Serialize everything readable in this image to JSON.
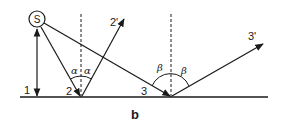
{
  "diagram": {
    "caption": "b",
    "source_label": "S",
    "labels": {
      "ray1": "1",
      "ray2_incident": "2",
      "ray2_reflected": "2'",
      "ray3_incident": "3",
      "ray3_reflected": "3'"
    },
    "angles": {
      "ray2_incidence": "α",
      "ray2_reflection": "α",
      "ray3_incidence": "β",
      "ray3_reflection": "β"
    },
    "colors": {
      "ink": "#1a1a1a",
      "background": "#ffffff"
    }
  }
}
